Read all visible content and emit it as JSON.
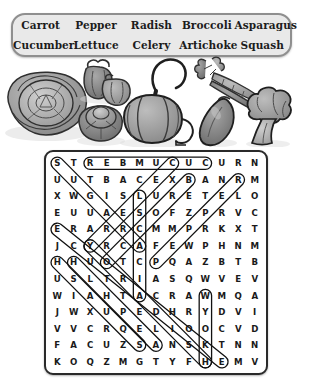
{
  "puzzle": {
    "theme": "Vegetables",
    "word_list": {
      "columns": [
        [
          "Carrot",
          "Cucumber"
        ],
        [
          "Pepper",
          "Lettuce"
        ],
        [
          "Radish",
          "Celery"
        ],
        [
          "Broccoli",
          "Artichoke"
        ],
        [
          "Asparagus",
          "Squash"
        ]
      ]
    },
    "illustrations": [
      {
        "name": "cabbage-illustration"
      },
      {
        "name": "bell-peppers-illustration"
      },
      {
        "name": "red-cabbage-illustration"
      },
      {
        "name": "pumpkin-squash-illustration"
      },
      {
        "name": "carrots-illustration"
      },
      {
        "name": "eggplant-illustration"
      },
      {
        "name": "broccoli-illustration"
      }
    ],
    "grid": {
      "rows": 13,
      "cols": 13,
      "letters": [
        [
          "S",
          "T",
          "R",
          "E",
          "B",
          "M",
          "U",
          "C",
          "U",
          "C",
          "U",
          "R",
          "N"
        ],
        [
          "U",
          "U",
          "T",
          "B",
          "A",
          "C",
          "E",
          "X",
          "B",
          "A",
          "N",
          "R",
          "M"
        ],
        [
          "X",
          "W",
          "G",
          "I",
          "S",
          "L",
          "U",
          "R",
          "E",
          "T",
          "E",
          "L",
          "O"
        ],
        [
          "E",
          "U",
          "U",
          "A",
          "E",
          "S",
          "O",
          "F",
          "Z",
          "P",
          "R",
          "V",
          "C"
        ],
        [
          "E",
          "R",
          "A",
          "R",
          "R",
          "C",
          "M",
          "M",
          "P",
          "R",
          "K",
          "X",
          "T"
        ],
        [
          "J",
          "C",
          "Y",
          "R",
          "C",
          "A",
          "F",
          "E",
          "W",
          "P",
          "H",
          "N",
          "M"
        ],
        [
          "H",
          "H",
          "U",
          "O",
          "T",
          "C",
          "P",
          "Q",
          "A",
          "Z",
          "B",
          "T",
          "B"
        ],
        [
          "U",
          "S",
          "L",
          "T",
          "R",
          "I",
          "A",
          "S",
          "Q",
          "W",
          "V",
          "E",
          "V"
        ],
        [
          "W",
          "I",
          "A",
          "H",
          "T",
          "A",
          "C",
          "R",
          "A",
          "W",
          "M",
          "Q",
          "A"
        ],
        [
          "J",
          "W",
          "X",
          "U",
          "P",
          "E",
          "D",
          "H",
          "R",
          "Y",
          "D",
          "V",
          "I"
        ],
        [
          "V",
          "V",
          "C",
          "R",
          "Q",
          "E",
          "L",
          "I",
          "O",
          "O",
          "C",
          "V",
          "D"
        ],
        [
          "F",
          "A",
          "C",
          "U",
          "Z",
          "S",
          "A",
          "N",
          "S",
          "K",
          "T",
          "N",
          "N"
        ],
        [
          "K",
          "O",
          "Q",
          "Z",
          "M",
          "G",
          "T",
          "Y",
          "F",
          "H",
          "E",
          "M",
          "V"
        ]
      ]
    },
    "solutions": [
      {
        "word": "CUCUMBER",
        "start_row": 0,
        "start_col": 9,
        "end_row": 0,
        "end_col": 2
      },
      {
        "word": "CARROT",
        "start_row": 0,
        "start_col": 0,
        "end_row": 5,
        "end_col": 5
      },
      {
        "word": "CELERY",
        "start_row": 0,
        "start_col": 7,
        "end_row": 5,
        "end_col": 2
      },
      {
        "word": "PEPPER",
        "start_row": 1,
        "start_col": 11,
        "end_row": 6,
        "end_col": 6
      },
      {
        "word": "RADISH",
        "start_row": 1,
        "start_col": 8,
        "end_row": 6,
        "end_col": 3
      },
      {
        "word": "LETTUCE",
        "start_row": 2,
        "start_col": 5,
        "end_row": 8,
        "end_col": 5
      },
      {
        "word": "ARTICHOKE",
        "start_row": 4,
        "start_col": 0,
        "end_row": 12,
        "end_col": 10
      },
      {
        "word": "BROCCOLI",
        "start_row": 5,
        "start_col": 2,
        "end_row": 12,
        "end_col": 9
      },
      {
        "word": "SQUASH",
        "start_row": 6,
        "start_col": 1,
        "end_row": 11,
        "end_col": 6
      },
      {
        "word": "ASPARAGUS",
        "start_row": 6,
        "start_col": 0,
        "end_row": 11,
        "end_col": 5
      },
      {
        "word": "PUMPKIN",
        "start_row": 8,
        "start_col": 9,
        "end_row": 12,
        "end_col": 9
      }
    ]
  },
  "colors": {
    "panel_background": "#e9e9e9",
    "panel_border": "#8f8f8f",
    "grid_border": "#2a2a2a",
    "letter_color": "#1a1a1a",
    "solution_stroke": "#111111",
    "page_background": "#ffffff"
  }
}
